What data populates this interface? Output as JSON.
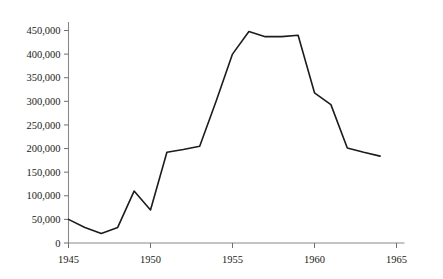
{
  "chart_data": {
    "type": "line",
    "title": "",
    "subtitle": "",
    "xlabel": "",
    "ylabel": "",
    "grid": false,
    "legend": false,
    "legend_position": "none",
    "line_color": "#1c1c1c",
    "axis_color": "#8a8a8a",
    "background_color": "#ffffff",
    "xlim": [
      1945,
      1965
    ],
    "ylim": [
      0,
      470000
    ],
    "x_ticks": [
      1945,
      1950,
      1955,
      1960,
      1965
    ],
    "x_tick_labels": [
      "1945",
      "1950",
      "1955",
      "1960",
      "1965"
    ],
    "y_ticks": [
      0,
      50000,
      100000,
      150000,
      200000,
      250000,
      300000,
      350000,
      400000,
      450000
    ],
    "y_tick_labels": [
      "0",
      "50,000",
      "100,000",
      "150,000",
      "200,000",
      "250,000",
      "300,000",
      "350,000",
      "400,000",
      "450,000"
    ],
    "x": [
      1945,
      1946,
      1947,
      1948,
      1949,
      1950,
      1951,
      1952,
      1953,
      1954,
      1955,
      1956,
      1957,
      1958,
      1959,
      1960,
      1961,
      1962,
      1963,
      1964
    ],
    "values": [
      50000,
      33000,
      20000,
      33000,
      110000,
      70000,
      192000,
      198000,
      205000,
      300000,
      400000,
      448000,
      437000,
      437000,
      440000,
      318000,
      293000,
      201000,
      192000,
      184000
    ],
    "series": [
      {
        "name": "series-1",
        "values": [
          50000,
          33000,
          20000,
          33000,
          110000,
          70000,
          192000,
          198000,
          205000,
          300000,
          400000,
          448000,
          437000,
          437000,
          440000,
          318000,
          293000,
          201000,
          192000,
          184000
        ]
      }
    ]
  }
}
